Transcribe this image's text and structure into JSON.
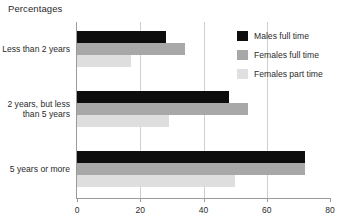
{
  "chart_data": {
    "type": "bar",
    "orientation": "horizontal",
    "title": "Percentages",
    "xlabel": "",
    "ylabel": "",
    "xlim": [
      0,
      80
    ],
    "xticks": [
      0,
      20,
      40,
      60,
      80
    ],
    "xtick_labels": [
      "0",
      "20",
      "40",
      "60",
      "80"
    ],
    "grid": true,
    "grid_axis": "x",
    "legend_position": "top-right",
    "categories": [
      "Less than 2 years",
      "2 years, but less\nthan 5 years",
      "5 years or more"
    ],
    "series": [
      {
        "name": "Males full time",
        "color": "#0d0d0d",
        "values": [
          28,
          48,
          72
        ]
      },
      {
        "name": "Females full time",
        "color": "#a8a8a8",
        "values": [
          34,
          54,
          72
        ]
      },
      {
        "name": "Females part time",
        "color": "#dedede",
        "values": [
          17,
          29,
          50
        ]
      }
    ]
  },
  "legend": {
    "items": [
      {
        "label": "Males full time",
        "swatch": "males-full-time"
      },
      {
        "label": "Females full time",
        "swatch": "females-full-time"
      },
      {
        "label": "Females part time",
        "swatch": "females-part-time"
      }
    ]
  }
}
